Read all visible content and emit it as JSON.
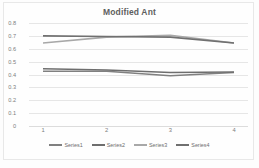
{
  "chart_data": {
    "type": "line",
    "title": "Modified Ant",
    "xlabel": "",
    "ylabel": "",
    "categories": [
      "1",
      "2",
      "3",
      "4"
    ],
    "x": [
      1,
      2,
      3,
      4
    ],
    "ylim": [
      0,
      0.8
    ],
    "ytick_labels": [
      "0.8",
      "0.7",
      "0.6",
      "0.5",
      "0.4",
      "0.3",
      "0.2",
      "0.1",
      "0"
    ],
    "ytick_values": [
      0.8,
      0.7,
      0.6,
      0.5,
      0.4,
      0.3,
      0.2,
      0.1,
      0
    ],
    "grid": true,
    "legend_position": "bottom",
    "series": [
      {
        "name": "Series1",
        "values": [
          0.425,
          0.425,
          0.39,
          0.415
        ],
        "color": "#808080"
      },
      {
        "name": "Series2",
        "values": [
          0.445,
          0.435,
          0.415,
          0.42
        ],
        "color": "#6e6e6e"
      },
      {
        "name": "Series3",
        "values": [
          0.645,
          0.69,
          0.705,
          0.645
        ],
        "color": "#a8a8a8"
      },
      {
        "name": "Series4",
        "values": [
          0.7,
          0.695,
          0.69,
          0.645
        ],
        "color": "#707070"
      }
    ]
  },
  "legend": {
    "items": [
      {
        "label": "Series1"
      },
      {
        "label": "Series2"
      },
      {
        "label": "Series3"
      },
      {
        "label": "Series4"
      }
    ]
  }
}
